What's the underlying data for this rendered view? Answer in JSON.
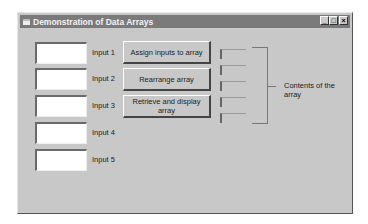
{
  "window": {
    "title": "Demonstration of Data Arrays",
    "controls": {
      "minimize": "_",
      "maximize": "□",
      "close": "×"
    }
  },
  "inputs": [
    {
      "label": "Input 1",
      "value": ""
    },
    {
      "label": "Input 2",
      "value": ""
    },
    {
      "label": "Input 3",
      "value": ""
    },
    {
      "label": "Input 4",
      "value": ""
    },
    {
      "label": "Input 5",
      "value": ""
    }
  ],
  "buttons": {
    "assign": "Assign inputs to array",
    "rearrange": "Rearrange array",
    "retrieve": "Retrieve and display array"
  },
  "outputs": [
    "",
    "",
    "",
    "",
    ""
  ],
  "contents_label": "Contents of the array"
}
